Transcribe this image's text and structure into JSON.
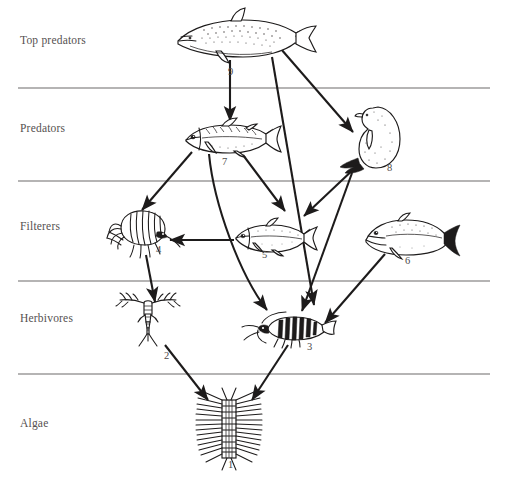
{
  "figure": {
    "background": "#ffffff",
    "ink_color": "#1d1b1b",
    "label_color": "#555151",
    "divider_color": "#6d6a6a",
    "width": 509,
    "height": 487
  },
  "trophic_levels": [
    {
      "id": "top-predators",
      "label": "Top predators",
      "label_x": 20,
      "label_y": 42
    },
    {
      "id": "predators",
      "label": "Predators",
      "label_x": 20,
      "label_y": 130
    },
    {
      "id": "filterers",
      "label": "Filterers",
      "label_x": 20,
      "label_y": 228
    },
    {
      "id": "herbivores",
      "label": "Herbivores",
      "label_x": 20,
      "label_y": 320
    },
    {
      "id": "algae",
      "label": "Algae",
      "label_x": 20,
      "label_y": 425
    }
  ],
  "dividers": [
    {
      "y": 88,
      "x1": 18,
      "x2": 490
    },
    {
      "y": 181,
      "x1": 18,
      "x2": 490
    },
    {
      "y": 281,
      "x1": 18,
      "x2": 490
    },
    {
      "y": 374,
      "x1": 18,
      "x2": 490
    }
  ],
  "organisms": [
    {
      "number": "1",
      "name": "diatom-chain",
      "level": "algae",
      "num_x": 228,
      "num_y": 466
    },
    {
      "number": "2",
      "name": "copepod",
      "level": "herbivores",
      "num_x": 164,
      "num_y": 357
    },
    {
      "number": "3",
      "name": "krill",
      "level": "herbivores",
      "num_x": 307,
      "num_y": 348
    },
    {
      "number": "4",
      "name": "amphipod",
      "level": "filterers",
      "num_x": 156,
      "num_y": 251
    },
    {
      "number": "5",
      "name": "small-fish",
      "level": "filterers",
      "num_x": 262,
      "num_y": 256
    },
    {
      "number": "6",
      "name": "baleen-fish",
      "level": "filterers",
      "num_x": 405,
      "num_y": 262
    },
    {
      "number": "7",
      "name": "predator-fish",
      "level": "predators",
      "num_x": 222,
      "num_y": 163
    },
    {
      "number": "8",
      "name": "seal",
      "level": "predators",
      "num_x": 387,
      "num_y": 169
    },
    {
      "number": "9",
      "name": "orca",
      "level": "top-predators",
      "num_x": 228,
      "num_y": 73
    }
  ],
  "feeding_links": [
    {
      "from": "9",
      "to": "7",
      "name": "orca-eats-predator-fish"
    },
    {
      "from": "9",
      "to": "8",
      "name": "orca-eats-seal"
    },
    {
      "from": "9",
      "to": "3",
      "name": "orca-eats-krill"
    },
    {
      "from": "7",
      "to": "4",
      "name": "predator-fish-eats-amphipod"
    },
    {
      "from": "7",
      "to": "5",
      "name": "predator-fish-eats-small-fish"
    },
    {
      "from": "7",
      "to": "3",
      "name": "predator-fish-eats-krill"
    },
    {
      "from": "8",
      "to": "5",
      "name": "seal-eats-small-fish"
    },
    {
      "from": "8",
      "to": "3",
      "name": "seal-eats-krill"
    },
    {
      "from": "5",
      "to": "4",
      "name": "small-fish-eats-amphipod"
    },
    {
      "from": "6",
      "to": "3",
      "name": "baleen-fish-eats-krill"
    },
    {
      "from": "4",
      "to": "2",
      "name": "amphipod-eats-copepod"
    },
    {
      "from": "2",
      "to": "1",
      "name": "copepod-eats-diatom"
    },
    {
      "from": "3",
      "to": "1",
      "name": "krill-eats-diatom"
    }
  ]
}
